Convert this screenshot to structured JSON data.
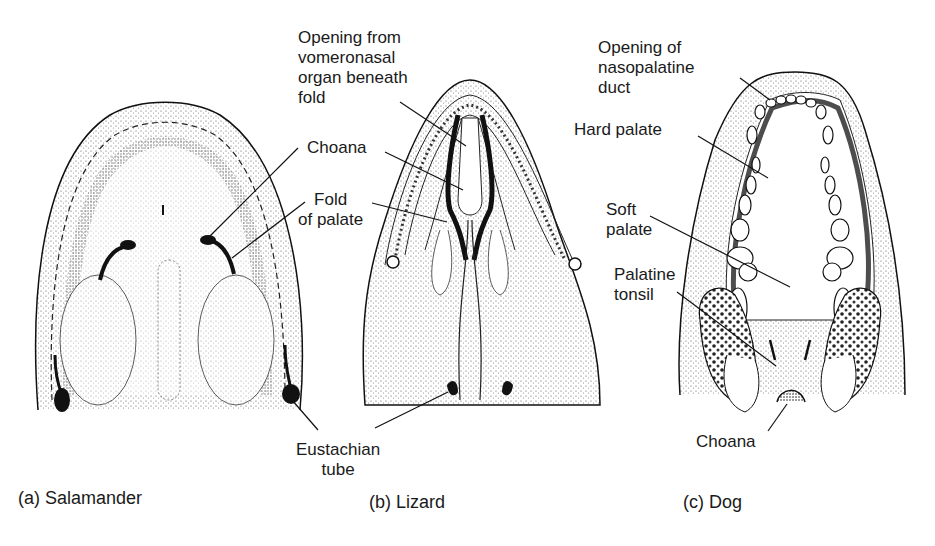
{
  "figure": {
    "panels": [
      {
        "id": "a",
        "caption": "(a) Salamander"
      },
      {
        "id": "b",
        "caption": "(b) Lizard"
      },
      {
        "id": "c",
        "caption": "(c) Dog"
      }
    ],
    "labels": {
      "vomeronasal_line1": "Opening from",
      "vomeronasal_line2": "vomeronasal",
      "vomeronasal_line3": "organ beneath",
      "vomeronasal_line4": "fold",
      "choana": "Choana",
      "fold_line1": "Fold",
      "fold_line2": "of palate",
      "eustachian_line1": "Eustachian",
      "eustachian_line2": "tube",
      "nasopalatine_line1": "Opening of",
      "nasopalatine_line2": "nasopalatine",
      "nasopalatine_line3": "duct",
      "hard_palate": "Hard palate",
      "soft_palate_line1": "Soft",
      "soft_palate_line2": "palate",
      "palatine_tonsil_line1": "Palatine",
      "palatine_tonsil_line2": "tonsil",
      "dog_choana": "Choana"
    },
    "colors": {
      "ink": "#1a1a1a",
      "background": "#ffffff",
      "stipple": "#555555"
    }
  }
}
